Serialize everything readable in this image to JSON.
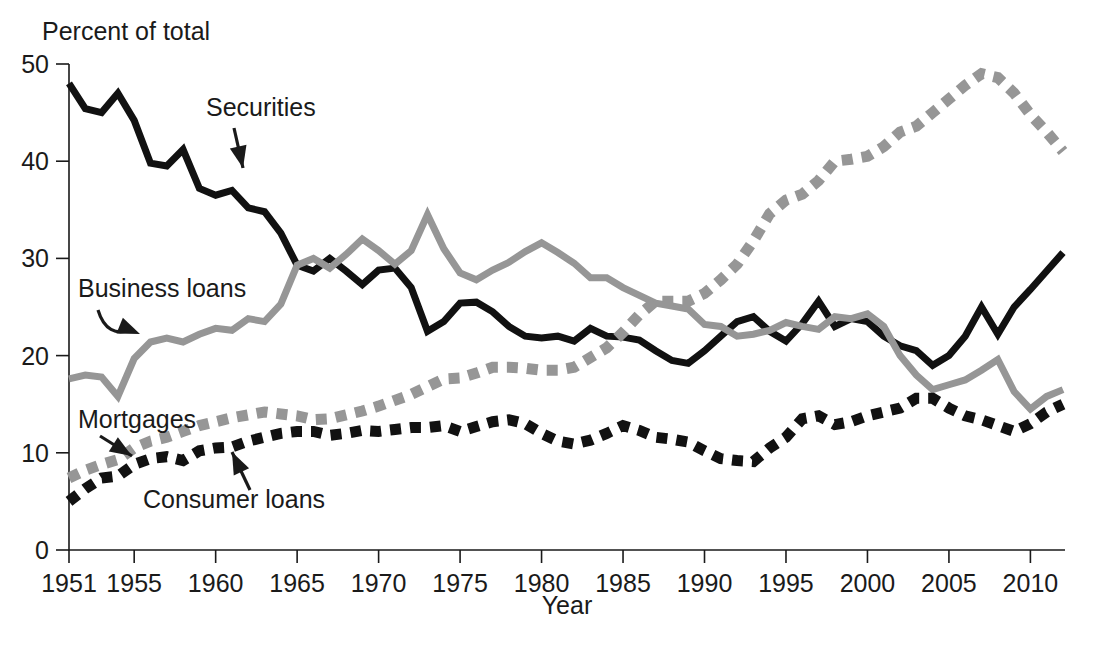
{
  "chart_data": {
    "type": "line",
    "title": "",
    "ylabel": "Percent of total",
    "xlabel": "Year",
    "ylim": [
      0,
      50
    ],
    "xlim": [
      1951,
      2012
    ],
    "yticks": [
      0,
      10,
      20,
      30,
      40,
      50
    ],
    "xticks": [
      1951,
      1955,
      1960,
      1965,
      1970,
      1975,
      1980,
      1985,
      1990,
      1995,
      2000,
      2005,
      2010
    ],
    "grid": false,
    "legend_position": "inline-annotations",
    "x": [
      1951,
      1952,
      1953,
      1954,
      1955,
      1956,
      1957,
      1958,
      1959,
      1960,
      1961,
      1962,
      1963,
      1964,
      1965,
      1966,
      1967,
      1968,
      1969,
      1970,
      1971,
      1972,
      1973,
      1974,
      1975,
      1976,
      1977,
      1978,
      1979,
      1980,
      1981,
      1982,
      1983,
      1984,
      1985,
      1986,
      1987,
      1988,
      1989,
      1990,
      1991,
      1992,
      1993,
      1994,
      1995,
      1996,
      1997,
      1998,
      1999,
      2000,
      2001,
      2002,
      2003,
      2004,
      2005,
      2006,
      2007,
      2008,
      2009,
      2010,
      2011,
      2012
    ],
    "series": [
      {
        "name": "Securities",
        "style": "solid",
        "color": "#111111",
        "values": [
          48.0,
          45.4,
          45.0,
          47.0,
          44.2,
          39.8,
          39.5,
          41.2,
          37.2,
          36.5,
          37.0,
          35.2,
          34.8,
          32.6,
          29.3,
          28.7,
          30.0,
          28.7,
          27.3,
          28.8,
          29.0,
          27.0,
          22.5,
          23.5,
          25.4,
          25.5,
          24.5,
          23.0,
          22.0,
          21.8,
          22.0,
          21.5,
          22.8,
          22.0,
          21.9,
          21.6,
          20.5,
          19.5,
          19.2,
          20.5,
          22.0,
          23.5,
          24.0,
          22.5,
          21.5,
          23.3,
          25.6,
          23.0,
          23.8,
          23.5,
          22.0,
          21.0,
          20.5,
          19.0,
          20.0,
          22.0,
          25.0,
          22.2,
          25.0,
          26.8,
          28.7,
          30.6
        ]
      },
      {
        "name": "Business loans",
        "style": "solid",
        "color": "#969696",
        "values": [
          17.6,
          18.0,
          17.8,
          15.8,
          19.7,
          21.4,
          21.8,
          21.4,
          22.2,
          22.8,
          22.6,
          23.8,
          23.5,
          25.3,
          29.3,
          30.0,
          29.0,
          30.4,
          32.0,
          30.8,
          29.4,
          30.8,
          34.5,
          31.0,
          28.5,
          27.8,
          28.8,
          29.6,
          30.7,
          31.6,
          30.6,
          29.5,
          28.0,
          28.0,
          27.0,
          26.2,
          25.4,
          25.1,
          24.8,
          23.2,
          23.0,
          22.0,
          22.2,
          22.6,
          23.4,
          23.0,
          22.7,
          24.0,
          23.8,
          24.3,
          23.0,
          20.0,
          18.0,
          16.5,
          17.0,
          17.5,
          18.5,
          19.6,
          16.3,
          14.5,
          15.8,
          16.5
        ]
      },
      {
        "name": "Mortgages",
        "style": "dashed",
        "color": "#969696",
        "values": [
          7.4,
          8.2,
          8.8,
          9.3,
          10.5,
          11.2,
          11.6,
          12.2,
          12.8,
          13.2,
          13.6,
          13.9,
          14.2,
          14.0,
          13.8,
          13.4,
          13.5,
          13.9,
          14.3,
          14.8,
          15.4,
          16.0,
          16.8,
          17.6,
          17.7,
          18.2,
          18.8,
          18.8,
          18.7,
          18.5,
          18.5,
          18.8,
          19.8,
          20.8,
          22.4,
          24.2,
          25.6,
          25.6,
          25.6,
          26.4,
          27.8,
          29.4,
          31.8,
          34.6,
          36.0,
          36.6,
          38.0,
          40.0,
          40.2,
          40.5,
          41.5,
          43.0,
          43.6,
          45.0,
          46.4,
          47.8,
          49.0,
          48.6,
          47.0,
          44.8,
          43.0,
          41.0
        ]
      },
      {
        "name": "Consumer loans",
        "style": "dashed",
        "color": "#111111",
        "values": [
          5.0,
          6.3,
          7.4,
          7.6,
          8.8,
          9.4,
          9.6,
          9.2,
          10.2,
          10.5,
          10.6,
          11.2,
          11.6,
          12.0,
          12.2,
          12.2,
          11.8,
          12.0,
          12.3,
          12.2,
          12.4,
          12.6,
          12.6,
          12.8,
          12.2,
          12.7,
          13.2,
          13.4,
          13.0,
          12.0,
          11.2,
          10.9,
          11.3,
          12.0,
          12.8,
          12.3,
          11.6,
          11.4,
          11.1,
          10.2,
          9.4,
          9.2,
          9.1,
          10.5,
          11.6,
          13.5,
          13.8,
          12.9,
          13.2,
          13.8,
          14.2,
          14.6,
          15.6,
          15.6,
          14.6,
          13.8,
          13.4,
          12.8,
          12.2,
          13.0,
          14.2,
          15.0
        ]
      }
    ],
    "annotations": [
      {
        "label": "Securities",
        "target_year": 1961,
        "target_value": 37.0
      },
      {
        "label": "Business loans",
        "target_year": 1956,
        "target_value": 21.4
      },
      {
        "label": "Mortgages",
        "target_year": 1958,
        "target_value": 12.2
      },
      {
        "label": "Consumer loans",
        "target_year": 1960,
        "target_value": 10.5
      }
    ]
  },
  "axis": {
    "y_title": "Percent of total",
    "x_title": "Year"
  }
}
